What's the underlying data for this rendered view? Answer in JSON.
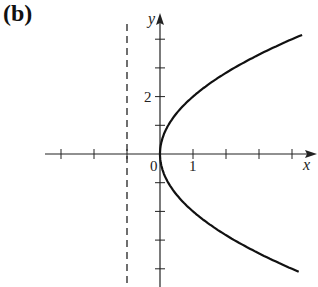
{
  "panel": {
    "label": "(b)"
  },
  "colors": {
    "curve": "#111111",
    "axis": "#222222",
    "background": "#ffffff"
  },
  "chart_data": {
    "type": "line",
    "title": "",
    "xlabel": "x",
    "ylabel": "y",
    "equation": "y^2 = 4x",
    "xlim": [
      -3.5,
      4.8
    ],
    "ylim": [
      -4.6,
      4.8
    ],
    "x_ticks": [
      -3,
      -2,
      -1,
      0,
      1,
      2,
      3,
      4
    ],
    "x_tick_labels": [
      {
        "value": 0,
        "text": "0"
      },
      {
        "value": 1,
        "text": "1"
      }
    ],
    "y_ticks": [
      -4,
      -3,
      -2,
      -1,
      0,
      1,
      2,
      3,
      4
    ],
    "y_tick_labels": [
      {
        "value": 2,
        "text": "2"
      }
    ],
    "grid": false,
    "series": [
      {
        "name": "parabola",
        "style": "solid",
        "points": [
          [
            4.3,
            4.15
          ],
          [
            3,
            3.46
          ],
          [
            2,
            2.83
          ],
          [
            1,
            2
          ],
          [
            0.5,
            1.41
          ],
          [
            0.25,
            1
          ],
          [
            0,
            0
          ],
          [
            0.25,
            -1
          ],
          [
            0.5,
            -1.41
          ],
          [
            1,
            -2
          ],
          [
            2,
            -2.83
          ],
          [
            3,
            -3.46
          ],
          [
            4.25,
            -4.12
          ]
        ]
      },
      {
        "name": "directrix",
        "style": "dashed",
        "x": -1,
        "y_range": [
          -4.6,
          4.5
        ]
      }
    ]
  },
  "layout": {
    "origin_px": [
      160,
      154
    ],
    "x_unit_px": 33,
    "y_unit_px": 28.7
  }
}
